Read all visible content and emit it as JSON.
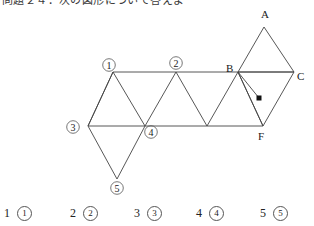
{
  "header": {
    "clipped_text": "問題２４．次の図形について答えよ"
  },
  "figure": {
    "vertex_labels": [
      {
        "id": "A",
        "text": "A",
        "x": 264,
        "y": 14
      },
      {
        "id": "B",
        "text": "B",
        "x": 229,
        "y": 69
      },
      {
        "id": "C",
        "text": "C",
        "x": 299,
        "y": 77
      },
      {
        "id": "F",
        "text": "F",
        "x": 261,
        "y": 137
      }
    ],
    "circled_labels": [
      {
        "id": "1",
        "text": "1",
        "cx": 109,
        "cy": 65
      },
      {
        "id": "2",
        "text": "2",
        "cx": 176,
        "cy": 63
      },
      {
        "id": "3",
        "text": "3",
        "cx": 73,
        "cy": 127
      },
      {
        "id": "4",
        "text": "4",
        "cx": 151,
        "cy": 132
      },
      {
        "id": "5",
        "text": "5",
        "cx": 117,
        "cy": 188
      }
    ],
    "marked_point": {
      "name": "point-marker",
      "x": 259,
      "y": 98
    },
    "line_color": "#444444"
  },
  "options": {
    "label": "answer-choices",
    "items": [
      {
        "num": "1",
        "circled": "1",
        "x": 4
      },
      {
        "num": "2",
        "circled": "2",
        "x": 70
      },
      {
        "num": "3",
        "circled": "3",
        "x": 134
      },
      {
        "num": "4",
        "circled": "4",
        "x": 196
      },
      {
        "num": "5",
        "circled": "5",
        "x": 260
      }
    ]
  }
}
